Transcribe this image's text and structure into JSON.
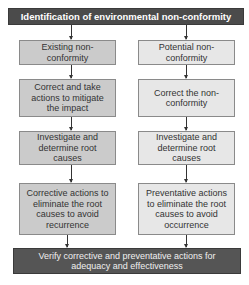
{
  "header": {
    "title": "Identification of environmental non-conformity"
  },
  "columns": {
    "left": {
      "steps": [
        "Existing non-conformity",
        "Correct and take actions to mitigate the impact",
        "Investigate and determine root causes",
        "Corrective actions to eliminate the root causes to avoid recurrence"
      ]
    },
    "right": {
      "steps": [
        "Potential non-conformity",
        "Correct the non-conformity",
        "Investigate and determine root causes",
        "Preventative actions to eliminate the root causes to avoid occurrence"
      ]
    }
  },
  "footer": {
    "text": "Verify corrective and preventative actions for adequacy and effectiveness"
  },
  "colors": {
    "bar": "#4b4b4b",
    "left_fill": "#cbcbcb",
    "right_fill": "#e7e7e7",
    "border": "#8a8a8a"
  }
}
